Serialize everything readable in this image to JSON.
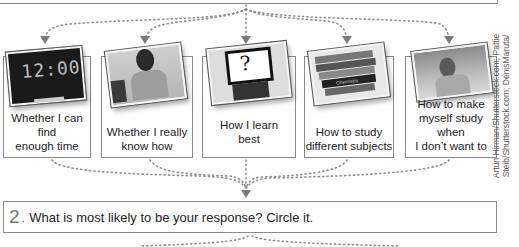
{
  "cards": [
    {
      "label_line1": "Whether I can find",
      "label_line2": "enough time",
      "image": "alarm-clock-1200"
    },
    {
      "label_line1": "Whether I really",
      "label_line2": "know how",
      "image": "man-portrait"
    },
    {
      "label_line1": "How I learn",
      "label_line2": "best",
      "image": "question-mark-sign"
    },
    {
      "label_line1": "How to study",
      "label_line2": "different subjects",
      "image": "stack-of-books"
    },
    {
      "label_line1": "How to make",
      "label_line2": "myself study when",
      "label_line3": "I don’t want to",
      "image": "woman-studying"
    }
  ],
  "clock_display": "12:00",
  "question_mark": "?",
  "book_spine_text": "Chemistry",
  "credit": {
    "line1": "Artun Hirman/Shutterstock.com; Pattie",
    "line2": "Steib/Shutterstock.com; DenisMaruta/"
  },
  "question": {
    "number": "2",
    "punct": ".",
    "text": "What is most likely to be your response? Circle it."
  },
  "colors": {
    "border": "#8a8a8a",
    "dots": "#8c8c8c",
    "text": "#222222"
  }
}
